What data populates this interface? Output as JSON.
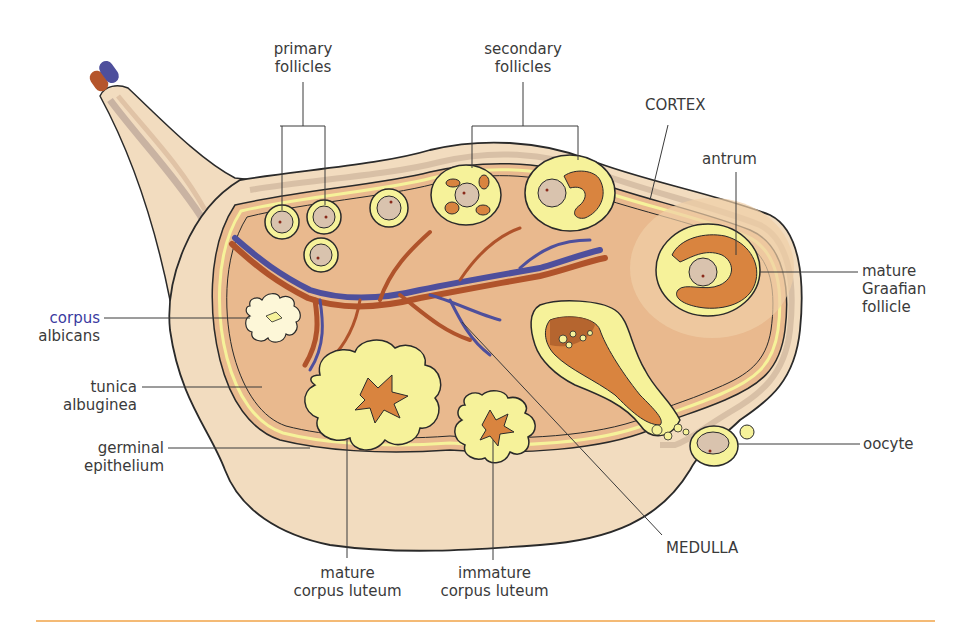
{
  "diagram": {
    "colors": {
      "outer_tissue": "#f2dcbf",
      "cortex": "#e9b98e",
      "follicle_ring": "#f6f29a",
      "oocyte": "#d9c3ae",
      "antrum": "#d9843f",
      "artery": "#b0532b",
      "vein": "#4e4f9c",
      "outline": "#2a2a2a",
      "footer_rule": "#f0a347"
    },
    "labels": {
      "primary_follicles": {
        "line1": "primary",
        "line2": "follicles"
      },
      "secondary_follicles": {
        "line1": "secondary",
        "line2": "follicles"
      },
      "cortex": {
        "line1": "CORTEX"
      },
      "antrum": {
        "line1": "antrum"
      },
      "mature_graafian_follicle": {
        "line1": "mature",
        "line2": "Graafian",
        "line3": "follicle"
      },
      "corpus_albicans": {
        "line1": "corpus",
        "line2": "albicans"
      },
      "tunica_albuginea": {
        "line1": "tunica",
        "line2": "albuginea"
      },
      "germinal_epithelium": {
        "line1": "germinal",
        "line2": "epithelium"
      },
      "oocyte": {
        "line1": "oocyte"
      },
      "medulla": {
        "line1": "MEDULLA"
      },
      "mature_corpus_luteum": {
        "line1": "mature",
        "line2": "corpus luteum"
      },
      "immature_corpus_luteum": {
        "line1": "immature",
        "line2": "corpus luteum"
      }
    }
  }
}
